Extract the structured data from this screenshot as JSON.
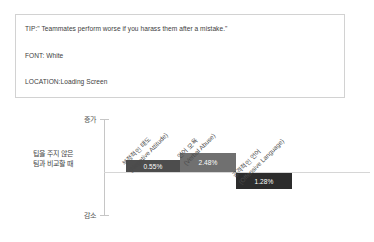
{
  "info_box": {
    "tip_line": "TIP:\" Teammates perform worse if you harass them after a mistake.\"",
    "font_line": "FONT: White",
    "location_line": "LOCATION:Loading Screen"
  },
  "chart_axis": {
    "top_label": "증가",
    "bottom_label": "감소",
    "left_label": "팁을 주지 않은\n팀과 비교할 때"
  },
  "chart_data": {
    "type": "bar",
    "title": "",
    "xlabel": "",
    "ylabel": "증가 / 감소",
    "categories": [
      "부정적인 태도\n(Negative Attitude)",
      "언어 모욕\n(Verbal Abuse)",
      "공격적인 언어\n(Offensive Language)"
    ],
    "values": [
      0.55,
      2.48,
      -1.28
    ],
    "value_labels": [
      "0.55%",
      "2.48%",
      "1.28%"
    ],
    "bar_colors": [
      "#4d4d4d",
      "#707070",
      "#2c2c2c"
    ],
    "baseline": 0,
    "grid": false,
    "legend": "none",
    "axis_top_label": "증가",
    "axis_bottom_label": "감소",
    "axis_left_annotation": "팁을 주지 않은 팀과 비교할 때"
  }
}
